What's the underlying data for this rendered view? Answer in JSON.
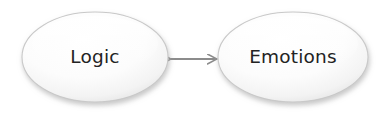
{
  "diagram": {
    "type": "concept-map",
    "background_color": "#ffffff",
    "nodes": [
      {
        "id": "logic",
        "label": "Logic",
        "shape": "ellipse",
        "cx": 95,
        "cy": 57,
        "rx": 73,
        "ry": 45,
        "fill_color": "#ffffff",
        "shade_color": "#e4e4e4",
        "border_color": "#c9c9c9",
        "text_color": "#232323"
      },
      {
        "id": "emotions",
        "label": "Emotions",
        "shape": "ellipse",
        "cx": 293,
        "cy": 57,
        "rx": 75,
        "ry": 45,
        "fill_color": "#ffffff",
        "shade_color": "#e4e4e4",
        "border_color": "#c9c9c9",
        "text_color": "#232323"
      }
    ],
    "edges": [
      {
        "id": "logic-emotions",
        "from": "logic",
        "to": "emotions",
        "label": "",
        "direction": "bidirectional",
        "arrowhead_style": "open",
        "stroke_color": "#8c8c8c",
        "x1": 169,
        "x2": 219,
        "y": 59
      }
    ]
  }
}
